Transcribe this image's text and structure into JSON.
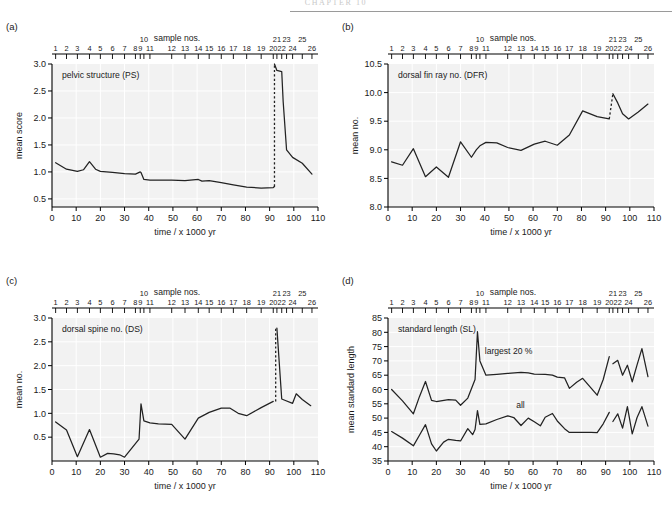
{
  "running_head": "CHAPTER 10",
  "common": {
    "xlabel": "time /  x 1000 yr",
    "sample_axis_title": "sample nos.",
    "xticks": [
      0,
      10,
      20,
      30,
      40,
      50,
      60,
      70,
      80,
      90,
      100,
      110
    ],
    "xlim": [
      0,
      110
    ],
    "sample_numbers": [
      1,
      2,
      3,
      4,
      5,
      6,
      7,
      8,
      9,
      10,
      11,
      12,
      13,
      14,
      15,
      16,
      17,
      18,
      19,
      20,
      21,
      22,
      23,
      24,
      25,
      26
    ],
    "sample_positions": [
      1.5,
      6.0,
      10.5,
      15.5,
      20.0,
      25.0,
      30.0,
      34.5,
      36.5,
      38.0,
      40.5,
      49.5,
      55.0,
      60.5,
      65.0,
      70.0,
      75.0,
      80.5,
      86.5,
      91.5,
      93.0,
      95.0,
      97.0,
      99.5,
      103.5,
      107.5
    ],
    "sample_upper_labels": [
      10,
      21,
      23,
      25
    ],
    "sample_lower_labels": [
      1,
      2,
      3,
      4,
      5,
      6,
      7,
      8,
      9,
      11,
      12,
      13,
      14,
      15,
      16,
      17,
      18,
      19,
      20,
      22,
      24,
      26
    ]
  },
  "panels": [
    {
      "letter": "(a)",
      "inplot_label": "pelvic structure (PS)",
      "ylabel": "mean score",
      "yticks": [
        0.5,
        1.0,
        1.5,
        2.0,
        2.5,
        3.0
      ],
      "ytick_labels": [
        "0.5",
        "1.0",
        "1.5",
        "2.0",
        "2.5",
        "3.0"
      ],
      "ylim": [
        0.35,
        3.0
      ],
      "chart_data": {
        "type": "line",
        "title": "pelvic structure (PS)",
        "xlabel": "time /  x 1000 yr",
        "ylabel": "mean score",
        "xlim": [
          0,
          110
        ],
        "ylim": [
          0.35,
          3.0
        ],
        "grid": true,
        "legend": "none",
        "series": [
          {
            "name": "pelvic structure (PS)",
            "x": [
              1.5,
              6.0,
              10.5,
              13.0,
              15.5,
              18.0,
              20.0,
              25.0,
              30.0,
              34.5,
              36.5,
              36.8,
              38.0,
              40.5,
              44.0,
              49.5,
              55.0,
              60.5,
              62.0,
              65.0,
              70.0,
              75.0,
              80.5,
              86.5,
              91.5,
              92.0
            ],
            "y": [
              1.17,
              1.05,
              1.01,
              1.04,
              1.19,
              1.05,
              1.01,
              0.99,
              0.97,
              0.96,
              1.0,
              0.99,
              0.86,
              0.85,
              0.85,
              0.85,
              0.84,
              0.86,
              0.83,
              0.84,
              0.8,
              0.76,
              0.72,
              0.7,
              0.71,
              0.73
            ]
          },
          {
            "name": "post-transition",
            "x": [
              92.0,
              93.0,
              95.0,
              95.6,
              97.0,
              99.5,
              103.5,
              107.5
            ],
            "y": [
              3.0,
              2.88,
              2.86,
              2.3,
              1.41,
              1.27,
              1.16,
              0.96
            ]
          }
        ],
        "dashed_connector": {
          "x": 92.0,
          "y_from": 0.73,
          "y_to": 3.0
        }
      }
    },
    {
      "letter": "(b)",
      "inplot_label": "dorsal fin ray no. (DFR)",
      "ylabel": "mean no.",
      "yticks": [
        8.0,
        8.5,
        9.0,
        9.5,
        10.0,
        10.5
      ],
      "ytick_labels": [
        "8.0",
        "8.5",
        "9.0",
        "9.5",
        "10.0",
        "10.5"
      ],
      "ylim": [
        8.0,
        10.5
      ],
      "chart_data": {
        "type": "line",
        "title": "dorsal fin ray no. (DFR)",
        "xlabel": "time /  x 1000 yr",
        "ylabel": "mean no.",
        "xlim": [
          0,
          110
        ],
        "ylim": [
          8.0,
          10.5
        ],
        "grid": true,
        "legend": "none",
        "series": [
          {
            "name": "dorsal fin ray no. (DFR)",
            "x": [
              1.5,
              6.0,
              10.5,
              15.5,
              20.0,
              25.0,
              30.0,
              34.5,
              36.5,
              38.0,
              40.5,
              45.0,
              49.5,
              55.0,
              60.5,
              65.0,
              70.0,
              75.0,
              80.5,
              86.5,
              91.5
            ],
            "y": [
              8.79,
              8.73,
              9.02,
              8.53,
              8.7,
              8.52,
              9.14,
              8.87,
              9.0,
              9.07,
              9.13,
              9.12,
              9.04,
              8.99,
              9.1,
              9.15,
              9.08,
              9.26,
              9.68,
              9.58,
              9.54
            ]
          },
          {
            "name": "post-transition",
            "x": [
              93.0,
              95.0,
              97.0,
              99.5,
              103.5,
              107.5
            ],
            "y": [
              9.98,
              9.82,
              9.63,
              9.54,
              9.66,
              9.8
            ]
          }
        ],
        "dashed_connector": {
          "x_from": 91.5,
          "x_to": 93.0,
          "y_from": 9.54,
          "y_to": 9.98
        }
      }
    },
    {
      "letter": "(c)",
      "inplot_label": "dorsal spine no. (DS)",
      "ylabel": "mean no.",
      "yticks": [
        0.5,
        1.0,
        1.5,
        2.0,
        2.5,
        3.0
      ],
      "ytick_labels": [
        "0.5",
        "1.0",
        "1.5",
        "2.0",
        "2.5",
        "3.0"
      ],
      "ylim": [
        0.0,
        3.0
      ],
      "chart_data": {
        "type": "line",
        "title": "dorsal spine no. (DS)",
        "xlabel": "time /  x 1000 yr",
        "ylabel": "mean no.",
        "xlim": [
          0,
          110
        ],
        "ylim": [
          0.0,
          3.0
        ],
        "grid": true,
        "legend": "none",
        "series": [
          {
            "name": "dorsal spine no. (DS)",
            "x": [
              1.5,
              6.0,
              10.5,
              15.5,
              20.0,
              23.0,
              25.5,
              28.0,
              30.0,
              36.0,
              36.8,
              38.0,
              40.5,
              44.0,
              49.5,
              55.0,
              60.5,
              65.0,
              70.0,
              73.5,
              77.0,
              80.5,
              86.5,
              91.5
            ],
            "y": [
              0.82,
              0.65,
              0.09,
              0.66,
              0.08,
              0.16,
              0.15,
              0.13,
              0.08,
              0.46,
              1.2,
              0.84,
              0.8,
              0.78,
              0.77,
              0.46,
              0.9,
              1.02,
              1.11,
              1.11,
              1.0,
              0.95,
              1.12,
              1.25
            ]
          },
          {
            "name": "post-transition",
            "x": [
              93.0,
              95.0,
              96.0,
              99.5,
              101.0,
              103.5,
              107.0
            ],
            "y": [
              2.79,
              1.3,
              1.28,
              1.21,
              1.41,
              1.29,
              1.16
            ]
          }
        ],
        "dashed_connector": {
          "x": 92.5,
          "y_from": 1.25,
          "y_to": 2.79
        }
      }
    },
    {
      "letter": "(d)",
      "inplot_label": "standard length (SL)",
      "ylabel": "mean standard length",
      "yticks": [
        35,
        40,
        45,
        50,
        55,
        60,
        65,
        70,
        75,
        80,
        85
      ],
      "ytick_labels": [
        "35",
        "40",
        "45",
        "50",
        "55",
        "60",
        "65",
        "70",
        "75",
        "80",
        "85"
      ],
      "ylim": [
        35,
        85
      ],
      "annotations": [
        "largest 20 %",
        "all"
      ],
      "chart_data": {
        "type": "line",
        "title": "standard length (SL)",
        "xlabel": "time /  x 1000 yr",
        "ylabel": "mean standard length",
        "xlim": [
          0,
          110
        ],
        "ylim": [
          35,
          85
        ],
        "grid": true,
        "legend": "inline-annotations",
        "series": [
          {
            "name": "largest 20 %",
            "x": [
              1.5,
              6.0,
              10.5,
              13.0,
              15.5,
              18.0,
              20.0,
              25.0,
              28.0,
              30.0,
              33.0,
              36.0,
              37.0,
              38.0,
              40.5,
              45.0,
              49.5,
              55.0,
              58.0,
              60.5,
              65.0,
              68.0,
              70.0,
              73.0,
              75.0,
              78.0,
              80.5,
              84.0,
              86.5,
              89.0,
              91.5
            ],
            "y": [
              60.0,
              56.0,
              51.5,
              57.5,
              62.8,
              56.2,
              55.8,
              56.5,
              56.3,
              54.5,
              57.0,
              63.5,
              80.2,
              70.0,
              65.0,
              65.3,
              65.6,
              66.0,
              65.8,
              65.4,
              65.3,
              65.0,
              64.3,
              64.1,
              60.4,
              62.5,
              63.9,
              60.5,
              58.0,
              63.5,
              71.5
            ]
          },
          {
            "name": "largest 20 % post",
            "x": [
              93.0,
              95.0,
              97.0,
              99.0,
              101.0,
              103.0,
              105.0,
              107.5
            ],
            "y": [
              69.0,
              70.2,
              65.0,
              68.5,
              62.7,
              68.6,
              74.3,
              64.5
            ]
          },
          {
            "name": "all",
            "x": [
              1.5,
              6.0,
              10.5,
              13.0,
              15.5,
              18.0,
              20.0,
              23.0,
              25.0,
              28.0,
              30.0,
              33.0,
              35.0,
              36.0,
              37.0,
              38.0,
              40.5,
              45.0,
              49.5,
              52.0,
              55.0,
              58.0,
              60.5,
              63.0,
              65.0,
              68.0,
              70.0,
              73.0,
              75.0,
              78.0,
              80.5,
              84.0,
              86.5,
              89.0,
              91.5
            ],
            "y": [
              45.3,
              43.0,
              40.3,
              44.0,
              47.7,
              41.0,
              38.5,
              41.6,
              42.6,
              42.2,
              42.0,
              46.3,
              44.2,
              46.0,
              52.6,
              47.8,
              48.0,
              49.5,
              50.8,
              50.2,
              47.4,
              50.0,
              48.7,
              47.3,
              50.3,
              51.6,
              49.0,
              46.3,
              45.0,
              45.0,
              45.0,
              45.0,
              44.9,
              48.0,
              52.0
            ]
          },
          {
            "name": "all post",
            "x": [
              93.0,
              95.0,
              97.0,
              99.0,
              101.0,
              103.0,
              105.0,
              107.5
            ],
            "y": [
              48.8,
              51.5,
              46.5,
              54.0,
              44.5,
              50.2,
              54.0,
              47.2
            ]
          }
        ]
      }
    }
  ]
}
